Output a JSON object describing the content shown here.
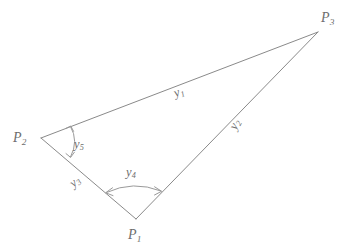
{
  "figure": {
    "background_color": "#ffffff",
    "line_color": "#8a8a8a",
    "text_color": "#6d6d6d"
  },
  "vertices": [
    {
      "name": "P1",
      "base": "P",
      "sub": "1",
      "x": 136,
      "y": 219,
      "label_x": 128,
      "label_y": 228
    },
    {
      "name": "P2",
      "base": "P",
      "sub": "2",
      "x": 41,
      "y": 138,
      "label_x": 13,
      "label_y": 131
    },
    {
      "name": "P3",
      "base": "P",
      "sub": "3",
      "x": 318,
      "y": 32,
      "label_x": 321,
      "label_y": 11
    }
  ],
  "sides": [
    {
      "name": "y1",
      "base": "y",
      "sub": "1",
      "from": "P2",
      "to": "P3",
      "label_x": 172,
      "label_y": 88,
      "rotation": -21
    },
    {
      "name": "y2",
      "base": "y",
      "sub": "2",
      "from": "P1",
      "to": "P3",
      "label_x": 227,
      "label_y": 126,
      "rotation": -63
    },
    {
      "name": "y3",
      "base": "y",
      "sub": "3",
      "from": "P2",
      "to": "P1",
      "label_x": 67,
      "label_y": 180,
      "rotation": -40
    }
  ],
  "angles": [
    {
      "name": "y4",
      "base": "y",
      "sub": "4",
      "at": "P1",
      "label_x": 126,
      "label_y": 166
    },
    {
      "name": "y5",
      "base": "y",
      "sub": "5",
      "at": "P2",
      "label_x": 74,
      "label_y": 138
    }
  ]
}
